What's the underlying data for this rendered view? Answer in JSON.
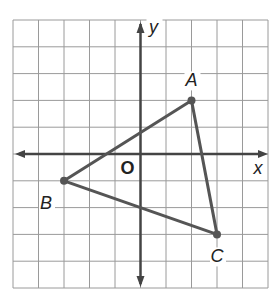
{
  "figure": {
    "type": "coordinate-plane-triangle",
    "grid": {
      "cols": 10,
      "rows": 10,
      "x_min": -5,
      "x_max": 5,
      "y_min": -5,
      "y_max": 5
    },
    "axes": {
      "x_label": "x",
      "y_label": "y",
      "origin_label": "O"
    },
    "points": [
      {
        "name": "A",
        "x": 2,
        "y": 2
      },
      {
        "name": "B",
        "x": -3,
        "y": -1
      },
      {
        "name": "C",
        "x": 3,
        "y": -3
      }
    ],
    "segments": [
      [
        "A",
        "B"
      ],
      [
        "B",
        "C"
      ],
      [
        "C",
        "A"
      ]
    ],
    "colors": {
      "grid": "#9a9a9a",
      "axis": "#444444",
      "triangle": "#555555",
      "label": "#222222"
    }
  }
}
